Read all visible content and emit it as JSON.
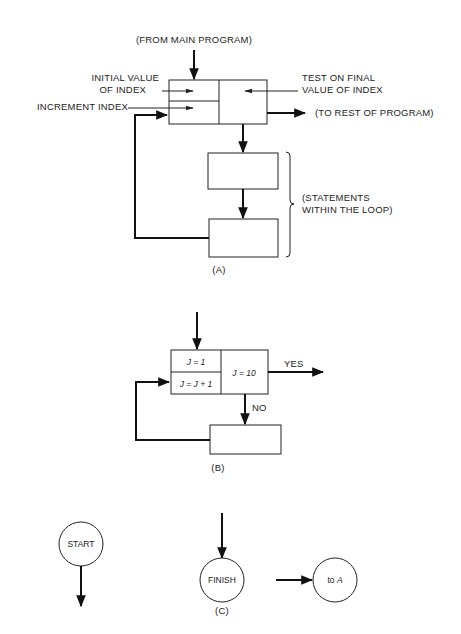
{
  "figure": {
    "section_a": {
      "caption": "(A)",
      "from_main": "(FROM MAIN PROGRAM)",
      "initial_value_line1": "INITIAL VALUE",
      "initial_value_line2": "OF INDEX",
      "increment_index": "INCREMENT INDEX",
      "test_final_line1": "TEST ON FINAL",
      "test_final_line2": "VALUE OF INDEX",
      "to_rest": "(TO REST OF PROGRAM)",
      "statements_line1": "(STATEMENTS",
      "statements_line2": "WITHIN THE LOOP)"
    },
    "section_b": {
      "caption": "(B)",
      "init": "J = 1",
      "increment": "J = J + 1",
      "test": "J = 10",
      "yes_label": "YES",
      "no_label": "NO"
    },
    "section_c": {
      "caption": "(C)",
      "start": "START",
      "finish": "FINISH",
      "connector_prefix": "to ",
      "connector_target": "A"
    }
  }
}
